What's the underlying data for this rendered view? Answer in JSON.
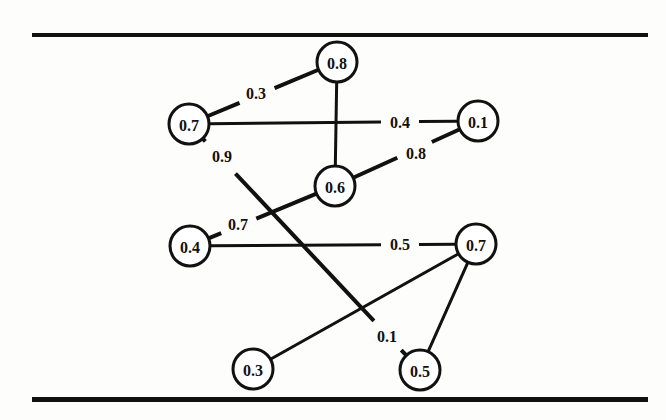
{
  "figure": {
    "kind": "weighted-undirected-graph-diagram",
    "background_color": "#fdfdfc",
    "ink_color": "#111111",
    "top_rule": {
      "x": 32,
      "y": 33,
      "width": 616,
      "height": 4
    },
    "bottom_rule": {
      "x": 32,
      "y": 397,
      "width": 616,
      "height": 5
    }
  },
  "chart_data": {
    "type": "diagram",
    "title": "",
    "xlabel": "",
    "ylabel": "",
    "nodes": [
      {
        "id": "n_08",
        "label": "0.8",
        "x": 337,
        "y": 62,
        "r": 20
      },
      {
        "id": "n_07a",
        "label": "0.7",
        "x": 189,
        "y": 124,
        "r": 20
      },
      {
        "id": "n_01",
        "label": "0.1",
        "x": 478,
        "y": 121,
        "r": 20
      },
      {
        "id": "n_06",
        "label": "0.6",
        "x": 335,
        "y": 186,
        "r": 20
      },
      {
        "id": "n_04",
        "label": "0.4",
        "x": 190,
        "y": 246,
        "r": 20
      },
      {
        "id": "n_07b",
        "label": "0.7",
        "x": 476,
        "y": 244,
        "r": 20
      },
      {
        "id": "n_03",
        "label": "0.3",
        "x": 253,
        "y": 369,
        "r": 20
      },
      {
        "id": "n_05",
        "label": "0.5",
        "x": 420,
        "y": 370,
        "r": 20
      }
    ],
    "edges": [
      {
        "id": "e_07a_08",
        "source": "n_07a",
        "target": "n_08",
        "weight": "0.3",
        "label_x": 256,
        "label_y": 93,
        "gap": 19,
        "stroke": 4
      },
      {
        "id": "e_08_06",
        "source": "n_08",
        "target": "n_06",
        "weight": null,
        "label_x": null,
        "label_y": null,
        "gap": 0,
        "stroke": 3
      },
      {
        "id": "e_07a_01",
        "source": "n_07a",
        "target": "n_01",
        "weight": "0.4",
        "label_x": 400,
        "label_y": 122,
        "gap": 19,
        "stroke": 3
      },
      {
        "id": "e_06_01",
        "source": "n_06",
        "target": "n_01",
        "weight": "0.8",
        "label_x": 416,
        "label_y": 153,
        "gap": 19,
        "stroke": 4
      },
      {
        "id": "e_07a_05",
        "source": "n_07a",
        "target": "n_05",
        "weight": "0.9",
        "label_x": 222,
        "label_y": 156,
        "gap": 22,
        "stroke": 4,
        "weight2": "0.1",
        "label2_x": 387,
        "label2_y": 336,
        "gap2": 20
      },
      {
        "id": "e_06_04",
        "source": "n_06",
        "target": "n_04",
        "weight": "0.7",
        "label_x": 238,
        "label_y": 224,
        "gap": 19,
        "stroke": 4
      },
      {
        "id": "e_04_07b",
        "source": "n_04",
        "target": "n_07b",
        "weight": "0.5",
        "label_x": 400,
        "label_y": 244,
        "gap": 19,
        "stroke": 3
      },
      {
        "id": "e_03_07b",
        "source": "n_03",
        "target": "n_07b",
        "weight": null,
        "label_x": null,
        "label_y": null,
        "gap": 0,
        "stroke": 3
      },
      {
        "id": "e_05_07b",
        "source": "n_05",
        "target": "n_07b",
        "weight": null,
        "label_x": null,
        "label_y": null,
        "gap": 0,
        "stroke": 3
      }
    ],
    "node_values": [
      "0.8",
      "0.7",
      "0.1",
      "0.6",
      "0.4",
      "0.7",
      "0.3",
      "0.5"
    ],
    "edge_weights": [
      "0.3",
      "0.4",
      "0.8",
      "0.9",
      "0.7",
      "0.5",
      "0.1"
    ],
    "grid": false,
    "legend": null
  }
}
